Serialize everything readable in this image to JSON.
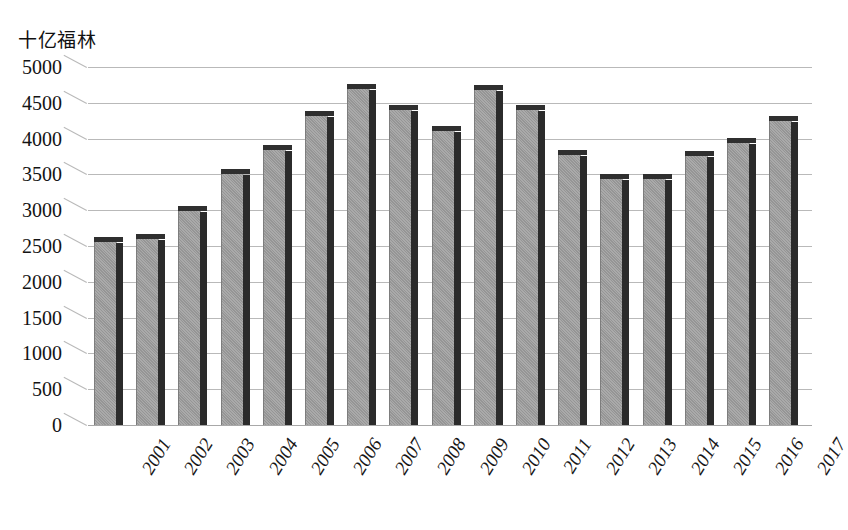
{
  "chart_data": {
    "type": "bar",
    "title": "十亿福林",
    "xlabel": "",
    "ylabel": "十亿福林",
    "categories": [
      "2001",
      "2002",
      "2003",
      "2004",
      "2005",
      "2006",
      "2007",
      "2008",
      "2009",
      "2010",
      "2011",
      "2012",
      "2013",
      "2014",
      "2015",
      "2016",
      "2017"
    ],
    "values": [
      2580,
      2630,
      3020,
      3530,
      3870,
      4350,
      4720,
      4430,
      4130,
      4700,
      4430,
      3800,
      3460,
      3470,
      3780,
      3960,
      4280
    ],
    "ylim": [
      0,
      5000
    ],
    "ytick_values": [
      0,
      500,
      1000,
      1500,
      2000,
      2500,
      3000,
      3500,
      4000,
      4500,
      5000
    ],
    "ytick_labels": [
      "0",
      "500",
      "1000",
      "1500",
      "2000",
      "2500",
      "3000",
      "3500",
      "4000",
      "4500",
      "5000"
    ],
    "grid": true,
    "legend": "none",
    "series": [
      {
        "name": "十亿福林",
        "values": [
          2580,
          2630,
          3020,
          3530,
          3870,
          4350,
          4720,
          4430,
          4130,
          4700,
          4430,
          3800,
          3460,
          3470,
          3780,
          3960,
          4280
        ]
      }
    ],
    "colors": {
      "bar_face": "#9c9c9c",
      "bar_shadow": "#2b2b2b",
      "gridline": "#b9b9b9",
      "text": "#131313",
      "background": "#ffffff"
    }
  }
}
